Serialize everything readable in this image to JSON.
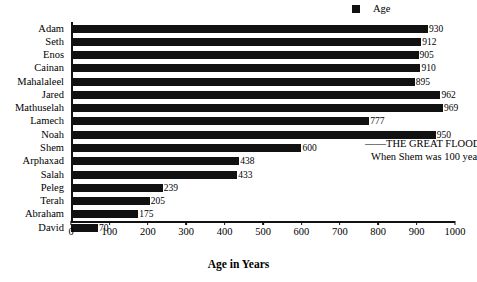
{
  "chart_data": {
    "type": "bar",
    "orientation": "horizontal",
    "title": "",
    "xlabel": "Age in Years",
    "ylabel": "",
    "xlim": [
      0,
      1000
    ],
    "xticks": [
      0,
      100,
      200,
      300,
      400,
      500,
      600,
      700,
      800,
      900,
      1000
    ],
    "grid": false,
    "legend": {
      "position": "top-right",
      "entries": [
        {
          "label": "Age",
          "color": "#111111",
          "marker": "square"
        }
      ]
    },
    "series_name": "Age",
    "bar_color": "#111111",
    "categories": [
      "Adam",
      "Seth",
      "Enos",
      "Cainan",
      "Mahalaleel",
      "Jared",
      "Mathuselah",
      "Lamech",
      "Noah",
      "Shem",
      "Arphaxad",
      "Salah",
      "Peleg",
      "Terah",
      "Abraham",
      "David"
    ],
    "values": [
      930,
      912,
      905,
      910,
      895,
      962,
      969,
      777,
      950,
      600,
      438,
      433,
      239,
      205,
      175,
      70
    ],
    "data_labels": [
      "930",
      "912",
      "905",
      "910",
      "895",
      "962",
      "969",
      "777",
      "950",
      "600",
      "438",
      "433",
      "239",
      "205",
      "175",
      "70"
    ],
    "annotations": [
      {
        "name": "great-flood",
        "line1": "——THE GREAT FLOOD——",
        "line2": "When Shem was 100 years old",
        "attached_to_category": "Shem"
      }
    ]
  }
}
